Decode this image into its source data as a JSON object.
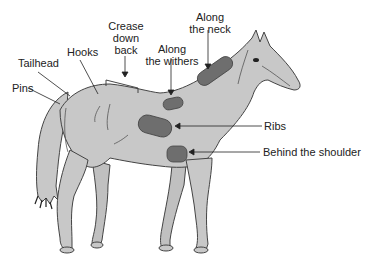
{
  "diagram": {
    "colors": {
      "body_fill": "#c8c8c8",
      "outline": "#444444",
      "patch_fill": "#6e6e6e",
      "label_text": "#222222",
      "background": "#ffffff"
    },
    "labels": {
      "pins": "Pins",
      "tailhead": "Tailhead",
      "hooks": "Hooks",
      "crease_line1": "Crease",
      "crease_line2": "down",
      "crease_line3": "back",
      "withers_line1": "Along",
      "withers_line2": "the withers",
      "neck_line1": "Along",
      "neck_line2": "the neck",
      "ribs": "Ribs",
      "behind_shoulder": "Behind the shoulder"
    }
  }
}
